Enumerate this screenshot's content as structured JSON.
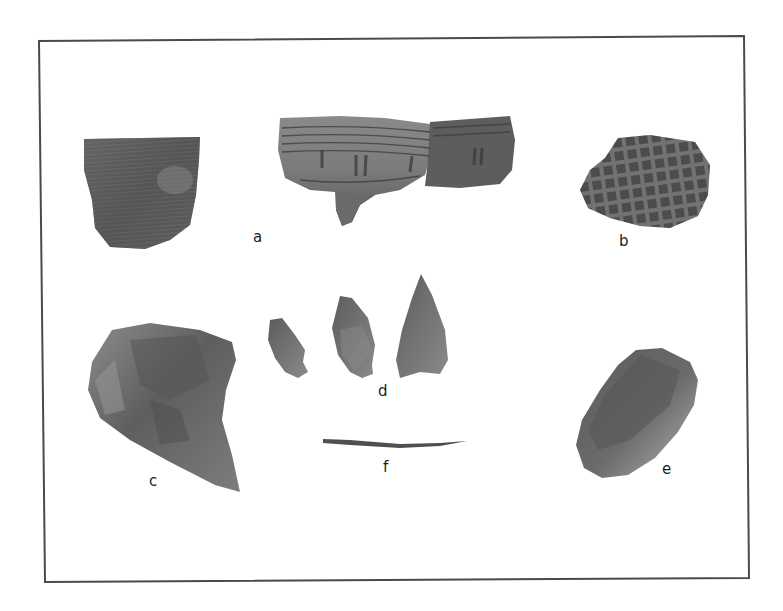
{
  "figure": {
    "frame": {
      "stroke": "#4a4a4a"
    },
    "artifacts": [
      {
        "id": "a1",
        "label": "a",
        "type": "pottery-sherd-cord-marked",
        "tone": "#5f5f5f"
      },
      {
        "id": "a2",
        "label": "a",
        "type": "pottery-rim-sherd-incised",
        "tone": "#6c6c6c"
      },
      {
        "id": "b",
        "label": "b",
        "type": "pottery-sherd-check-stamped",
        "tone": "#555555"
      },
      {
        "id": "c",
        "label": "c",
        "type": "stone-core-or-biface",
        "tone": "#6a6a6a"
      },
      {
        "id": "d",
        "label": "d",
        "type": "projectile-points",
        "count": 3,
        "tone": "#6e6e6e"
      },
      {
        "id": "e",
        "label": "e",
        "type": "stone-tool-scraper",
        "tone": "#707070"
      },
      {
        "id": "f",
        "label": "f",
        "type": "bone-pin",
        "tone": "#555555"
      }
    ],
    "labels": {
      "a": "a",
      "b": "b",
      "c": "c",
      "d": "d",
      "e": "e",
      "f": "f"
    }
  }
}
